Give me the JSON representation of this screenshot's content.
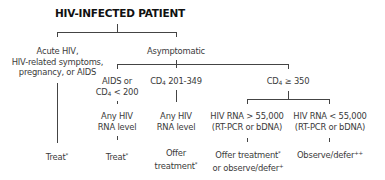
{
  "title": "HIV-INFECTED PATIENT",
  "nodes": {
    "acute": [
      "Acute HIV,",
      "HIV-related symptoms,",
      "pregnancy, or AIDS"
    ],
    "asymptomatic": "Asymptomatic",
    "aids_cd4": {
      "line1": "AIDS or",
      "prefix": "CD",
      "sub": "4",
      "suffix": " < 200"
    },
    "cd4_mid": {
      "prefix": "CD",
      "sub": "4",
      "suffix": " 201-349"
    },
    "cd4_high": {
      "prefix": "CD",
      "sub": "4",
      "suffix": " ≥ 350"
    },
    "any_rna_1": [
      "Any HIV",
      "RNA level"
    ],
    "any_rna_2": [
      "Any HIV",
      "RNA level"
    ],
    "rna_high": [
      "HIV RNA > 55,000",
      "(RT-PCR or bDNA)"
    ],
    "rna_low": [
      "HIV RNA < 55,000",
      "(RT-PCR or bDNA)"
    ]
  },
  "outcomes": {
    "treat_1": {
      "text": "Treat",
      "mark": "*"
    },
    "treat_2": {
      "text": "Treat",
      "mark": "*"
    },
    "offer": {
      "line1": "Offer",
      "line2": "treatment",
      "mark": "*"
    },
    "offer_or_observe": {
      "line1": "Offer treatment",
      "mark1": "*",
      "line2": "or observe/defer",
      "mark2": "+"
    },
    "observe": {
      "text": "Observe/defer",
      "mark": "++"
    }
  }
}
